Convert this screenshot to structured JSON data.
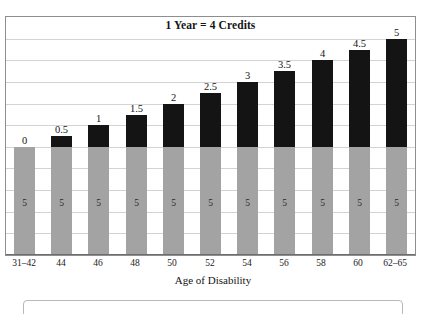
{
  "top_sliver_text": "",
  "chart_data": {
    "type": "bar",
    "title": "1 Year = 4 Credits",
    "xlabel": "Age of Disability",
    "ylabel": "",
    "grid": true,
    "legend": "none",
    "stacked": true,
    "ylim": [
      0,
      11
    ],
    "gridlines": 11,
    "categories": [
      "31–42",
      "44",
      "46",
      "48",
      "50",
      "52",
      "54",
      "56",
      "58",
      "60",
      "62–65"
    ],
    "series": [
      {
        "name": "Recent work credits",
        "color": "#a3a3a3",
        "values": [
          5,
          5,
          5,
          5,
          5,
          5,
          5,
          5,
          5,
          5,
          5
        ],
        "labels": [
          "5",
          "5",
          "5",
          "5",
          "5",
          "5",
          "5",
          "5",
          "5",
          "5",
          "5"
        ]
      },
      {
        "name": "Additional credits",
        "color": "#141414",
        "values": [
          0,
          0.5,
          1,
          1.5,
          2,
          2.5,
          3,
          3.5,
          4,
          4.5,
          5
        ],
        "labels": [
          "0",
          "0.5",
          "1",
          "1.5",
          "2",
          "2.5",
          "3",
          "3.5",
          "4",
          "4.5",
          "5"
        ]
      }
    ]
  },
  "bottom_box": {
    "text": ""
  }
}
